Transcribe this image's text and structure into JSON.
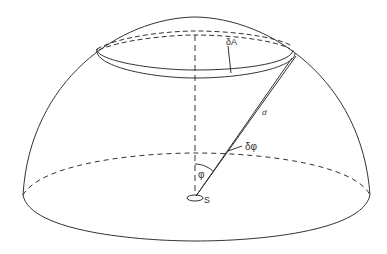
{
  "diagram": {
    "type": "hemisphere-geometry",
    "labels": {
      "area_element": "δA",
      "distance": "d",
      "angle_increment": "δφ",
      "angle": "φ",
      "source": "S"
    },
    "colors": {
      "line": "#333333",
      "background": "#ffffff"
    }
  }
}
